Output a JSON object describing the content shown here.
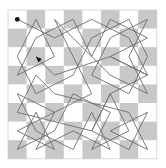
{
  "diagram": {
    "type": "knights-tour",
    "board": {
      "rows": 8,
      "cols": 8,
      "origin_x": 8,
      "origin_y": 10,
      "cell_size": 18.6,
      "light_color": "#ffffff",
      "dark_color": "#c8c8c8",
      "border_color": "#d0d0d0",
      "top_left_is_light": true
    },
    "path": {
      "stroke_color": "#6e6e6e",
      "stroke_width": 0.9,
      "start_marker": {
        "shape": "dot",
        "color": "#111111",
        "cell": [
          0,
          0
        ]
      },
      "end_marker": {
        "shape": "arrow",
        "color": "#111111",
        "cell": [
          2,
          1
        ]
      },
      "cells": [
        [
          0,
          0
        ],
        [
          1,
          2
        ],
        [
          0,
          4
        ],
        [
          1,
          6
        ],
        [
          3,
          7
        ],
        [
          2,
          5
        ],
        [
          1,
          7
        ],
        [
          0,
          5
        ],
        [
          2,
          4
        ],
        [
          0,
          3
        ],
        [
          1,
          1
        ],
        [
          3,
          0
        ],
        [
          2,
          2
        ],
        [
          0,
          1
        ],
        [
          2,
          0
        ],
        [
          4,
          1
        ],
        [
          3,
          3
        ],
        [
          1,
          4
        ],
        [
          0,
          6
        ],
        [
          2,
          7
        ],
        [
          4,
          6
        ],
        [
          3,
          4
        ],
        [
          1,
          5
        ],
        [
          0,
          7
        ],
        [
          2,
          6
        ],
        [
          4,
          7
        ],
        [
          3,
          5
        ],
        [
          1,
          3
        ],
        [
          0,
          2
        ],
        [
          2,
          3
        ],
        [
          4,
          4
        ],
        [
          5,
          2
        ],
        [
          7,
          1
        ],
        [
          6,
          3
        ],
        [
          7,
          5
        ],
        [
          5,
          4
        ],
        [
          7,
          3
        ],
        [
          6,
          1
        ],
        [
          4,
          0
        ],
        [
          5,
          2
        ],
        [
          6,
          0
        ],
        [
          7,
          2
        ],
        [
          5,
          1
        ],
        [
          7,
          0
        ],
        [
          6,
          2
        ],
        [
          4,
          3
        ],
        [
          5,
          5
        ],
        [
          7,
          4
        ],
        [
          6,
          6
        ],
        [
          4,
          5
        ],
        [
          6,
          4
        ],
        [
          7,
          6
        ],
        [
          5,
          7
        ],
        [
          6,
          5
        ],
        [
          7,
          7
        ],
        [
          5,
          6
        ],
        [
          4,
          2
        ],
        [
          3,
          1
        ],
        [
          5,
          0
        ],
        [
          6,
          4
        ],
        [
          4,
          5
        ],
        [
          3,
          7
        ],
        [
          2,
          5
        ],
        [
          3,
          2
        ],
        [
          2,
          1
        ]
      ]
    }
  }
}
